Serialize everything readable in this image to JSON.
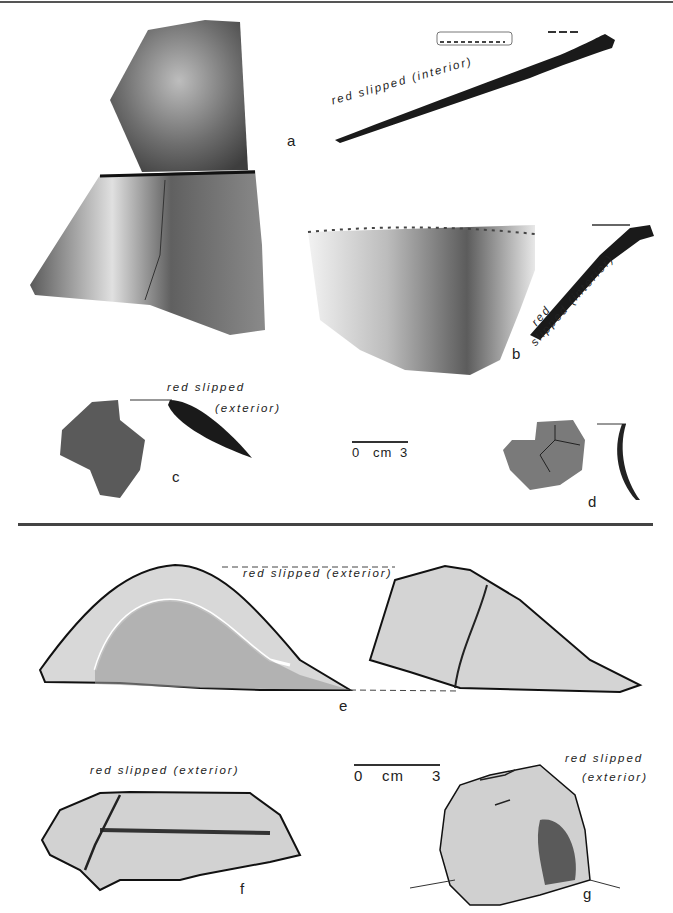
{
  "page": {
    "top_rule": true,
    "divider_rule": true
  },
  "figures": [
    {
      "id": "a",
      "label": "a",
      "type": "photo-and-profile",
      "annotation": "red slipped (interior)"
    },
    {
      "id": "b",
      "label": "b",
      "type": "photo-and-profile",
      "annotation_line1": "red",
      "annotation_line2": "slipped (interior)"
    },
    {
      "id": "c",
      "label": "c",
      "type": "photo-and-profile",
      "annotation_line1": "red slipped",
      "annotation_line2": "(exterior)"
    },
    {
      "id": "d",
      "label": "d",
      "type": "photo-and-profile"
    },
    {
      "id": "e",
      "label": "e",
      "type": "drawing",
      "annotation": "red slipped (exterior)"
    },
    {
      "id": "f",
      "label": "f",
      "type": "drawing",
      "annotation": "red slipped (exterior)"
    },
    {
      "id": "g",
      "label": "g",
      "type": "drawing",
      "annotation_line1": "red slipped",
      "annotation_line2": "(exterior)"
    }
  ],
  "scales": [
    {
      "start": "0",
      "unit": "cm",
      "end": "3"
    },
    {
      "start": "0",
      "unit": "cm",
      "end": "3"
    }
  ]
}
